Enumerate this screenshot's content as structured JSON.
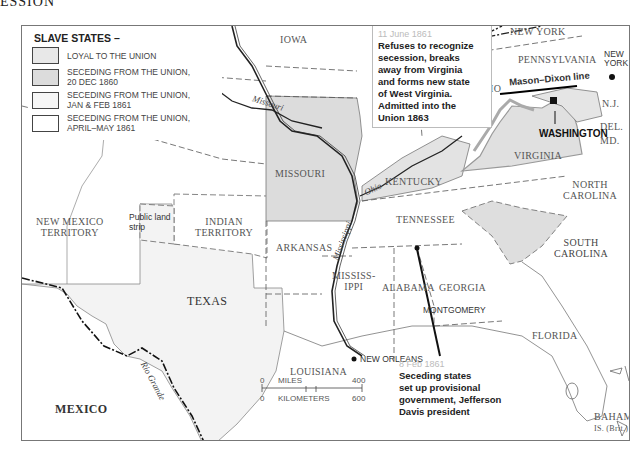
{
  "page": {
    "title_fragment": "ESSION"
  },
  "legend": {
    "heading": "SLAVE STATES –",
    "items": [
      {
        "label": "LOYAL TO THE UNION",
        "color": "#e8e8e8"
      },
      {
        "label": "SECEDING FROM THE UNION,\n20 DEC 1860",
        "line1": "SECEDING FROM THE UNION,",
        "line2": "20 DEC 1860",
        "color": "#dcdcdc"
      },
      {
        "label": "SECEDING FROM THE UNION,\nJAN & FEB 1861",
        "line1": "SECEDING FROM THE UNION,",
        "line2": "JAN & FEB 1861",
        "color": "#f6f6f6"
      },
      {
        "label": "SECEDING FROM THE UNION,\nAPRIL–MAY 1861",
        "line1": "SECEDING FROM THE UNION,",
        "line2": "APRIL–MAY 1861",
        "color": "#ffffff"
      }
    ]
  },
  "regions": {
    "iowa": "IOWA",
    "missouri": "MISSOURI",
    "kentucky": "KENTUCKY",
    "tennessee": "TENNESSEE",
    "arkansas": "ARKANSAS",
    "mississippi_1": "MISSISS-",
    "mississippi_2": "IPPI",
    "alabama": "ALABAMA",
    "georgia": "GEORGIA",
    "louisiana": "LOUISIANA",
    "texas": "TEXAS",
    "florida": "FLORIDA",
    "ohio": "OHIO",
    "pennsylvania": "PENNSYLVANIA",
    "virginia": "VIRGINIA",
    "north_carolina_1": "NORTH",
    "north_carolina_2": "CAROLINA",
    "south_carolina_1": "SOUTH",
    "south_carolina_2": "CAROLINA",
    "new_york": "NEW YORK",
    "nj": "N.J.",
    "del": "DEL.",
    "md": "MD.",
    "new_mexico_1": "NEW MEXICO",
    "new_mexico_2": "TERRITORY",
    "indian_1": "INDIAN",
    "indian_2": "TERRITORY",
    "public_land_1": "Public land",
    "public_land_2": "strip",
    "mexico": "MEXICO",
    "bahama_1": "BAHAMA",
    "bahama_2": "IS. (Brit.)"
  },
  "cities": {
    "new_york_1": "NEW",
    "new_york_2": "YORK",
    "washington": "WASHINGTON",
    "montgomery": "MONTGOMERY",
    "new_orleans": "NEW ORLEANS"
  },
  "rivers": {
    "missouri": "Missouri",
    "ohio": "Ohio",
    "mississippi": "Mississippi",
    "rio_grande": "Rio Grande"
  },
  "lines": {
    "mason_dixon": "Mason–Dixon line"
  },
  "callouts": {
    "west_virginia": {
      "date": "11 June 1861",
      "text": "Refuses to recognize\nsecession, breaks\naway from Virginia\nand forms new state\nof West Virginia.\nAdmitted into the\nUnion 1863"
    },
    "montgomery": {
      "date": "8 Feb 1861",
      "text": "Seceding states\nset up provisional\ngovernment, Jefferson\nDavis president"
    }
  },
  "scale": {
    "miles_start": "0",
    "miles_label": "MILES",
    "miles_end": "400",
    "km_start": "0",
    "km_label": "KILOMETERS",
    "km_end": "600"
  }
}
